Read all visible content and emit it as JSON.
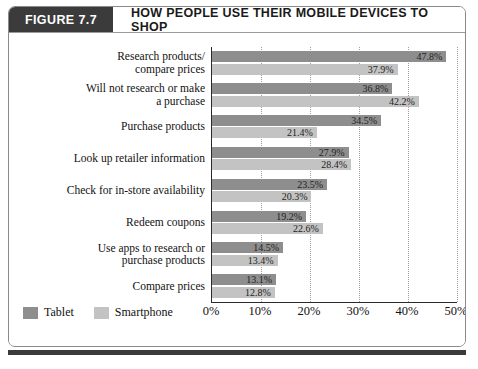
{
  "figure": {
    "tag": "FIGURE 7.7",
    "title": "HOW PEOPLE USE THEIR MOBILE DEVICES TO SHOP"
  },
  "legend": {
    "tablet_label": "Tablet",
    "smartphone_label": "Smartphone"
  },
  "source_note": "",
  "chart_data": {
    "type": "bar",
    "orientation": "horizontal",
    "title": "HOW PEOPLE USE THEIR MOBILE DEVICES TO SHOP",
    "xlabel": "",
    "ylabel": "",
    "xlim": [
      0,
      50
    ],
    "grid": true,
    "legend_position": "bottom-left",
    "xticks": [
      "0%",
      "10%",
      "20%",
      "30%",
      "40%",
      "50%"
    ],
    "xtick_values": [
      0,
      10,
      20,
      30,
      40,
      50
    ],
    "categories": [
      "Research products/\ncompare prices",
      "Will not research or make\na purchase",
      "Purchase products",
      "Look up retailer information",
      "Check for in-store availability",
      "Redeem coupons",
      "Use apps to research or\npurchase products",
      "Compare prices"
    ],
    "series": [
      {
        "name": "Tablet",
        "color": "#8e8e8e",
        "values": [
          47.8,
          36.8,
          34.5,
          27.9,
          23.5,
          19.2,
          14.5,
          13.1
        ],
        "labels": [
          "47.8%",
          "36.8%",
          "34.5%",
          "27.9%",
          "23.5%",
          "19.2%",
          "14.5%",
          "13.1%"
        ]
      },
      {
        "name": "Smartphone",
        "color": "#c3c3c3",
        "values": [
          37.9,
          42.2,
          21.4,
          28.4,
          20.3,
          22.6,
          13.4,
          12.8
        ],
        "labels": [
          "37.9%",
          "42.2%",
          "21.4%",
          "28.4%",
          "20.3%",
          "22.6%",
          "13.4%",
          "12.8%"
        ]
      }
    ]
  }
}
